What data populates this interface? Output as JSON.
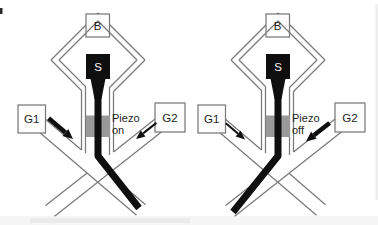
{
  "figure": {
    "colors": {
      "background": "#ffffff",
      "wall": "#7a7a7a",
      "stream": "#0f0f0f",
      "piezo": "#9a9a9a",
      "text": "#1f1f1f",
      "box_fill": "#fdfdfd"
    },
    "panels": [
      {
        "name": "piezo-on",
        "buffer_label": "B",
        "sample_label": "S",
        "gate1_label": "G1",
        "gate2_label": "G2",
        "piezo_label_line1": "Piezo",
        "piezo_label_line2": "on",
        "strong_flow_gate": "G1",
        "stream_deflection": "lower-right"
      },
      {
        "name": "piezo-off",
        "buffer_label": "B",
        "sample_label": "S",
        "gate1_label": "G1",
        "gate2_label": "G2",
        "piezo_label_line1": "Piezo",
        "piezo_label_line2": "off",
        "strong_flow_gate": "G2",
        "stream_deflection": "lower-left"
      }
    ]
  }
}
